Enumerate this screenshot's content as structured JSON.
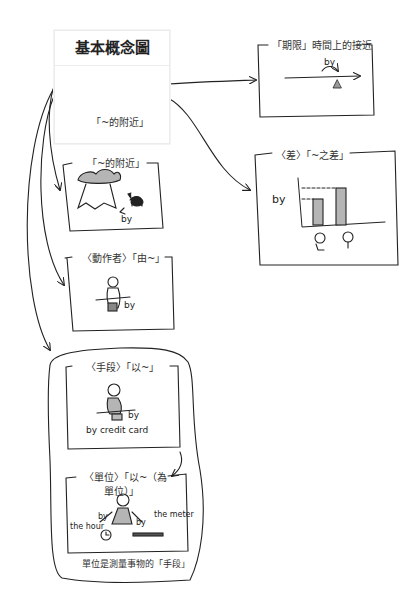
{
  "core": {
    "title": "基本概念圖",
    "label": "「~的附近」",
    "icon": "square-with-dot-icon"
  },
  "panels": [
    {
      "id": "period",
      "title": "「期限」時間上的接近",
      "annotations": [
        "by"
      ]
    },
    {
      "id": "difference",
      "title": "〈差〉「~之差」",
      "annotations": [
        "by"
      ]
    },
    {
      "id": "vicinity",
      "title": "「~的附近」",
      "annotations": [
        "by"
      ]
    },
    {
      "id": "agent",
      "title": "〈動作者〉「由~」",
      "annotations": [
        "by"
      ]
    },
    {
      "id": "means",
      "title": "〈手段〉「以~」",
      "annotations": [
        "by",
        "by credit card"
      ]
    },
    {
      "id": "unit",
      "title_line1": "〈單位〉「以~（為",
      "title_line2": "單位）」",
      "annotations": [
        "by",
        "the hour",
        "by",
        "the meter"
      ]
    }
  ],
  "group_caption": "單位是測量事物的「手段」",
  "colors": {
    "ink": "#222222",
    "fill_gray": "#b5b5b5",
    "background": "#ffffff",
    "core_border": "#ececec"
  }
}
